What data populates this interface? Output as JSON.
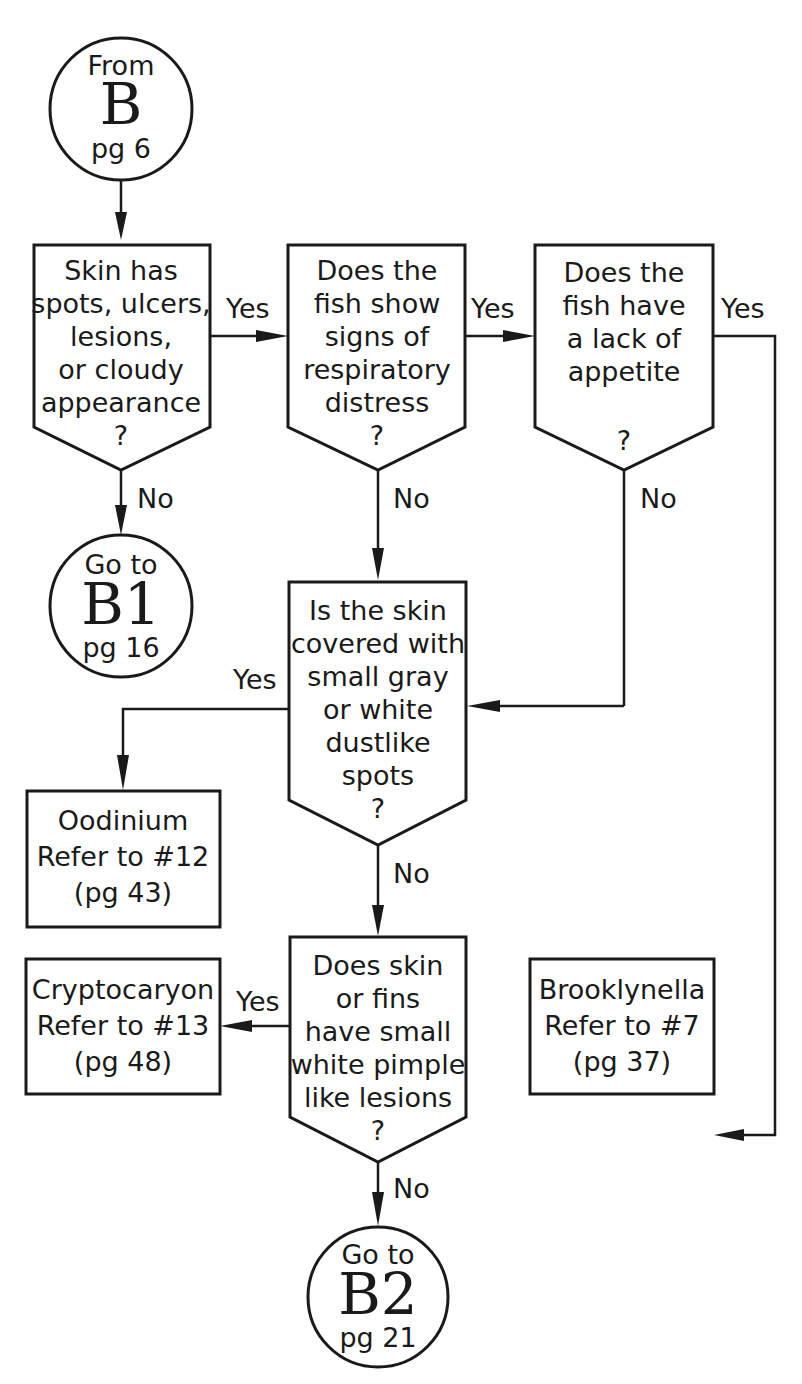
{
  "flowchart": {
    "start": {
      "line1": "From",
      "code": "B",
      "page": "pg 6"
    },
    "q1": {
      "lines": [
        "Skin has",
        "spots, ulcers,",
        "lesions,",
        "or cloudy",
        "appearance",
        "?"
      ]
    },
    "q2": {
      "lines": [
        "Does the",
        "fish show",
        "signs of",
        "respiratory",
        "distress",
        "?"
      ]
    },
    "q3": {
      "lines": [
        "Does the",
        "fish have",
        "a lack of",
        "appetite",
        "",
        "?"
      ]
    },
    "q4": {
      "lines": [
        "Is the skin",
        "covered with",
        "small gray",
        "or white",
        "dustlike",
        "spots",
        "?"
      ]
    },
    "q5": {
      "lines": [
        "Does skin",
        "or fins",
        "have small",
        "white pimple",
        "like lesions",
        "?"
      ]
    },
    "goto_b1": {
      "line1": "Go to",
      "code": "B1",
      "page": "pg 16"
    },
    "goto_b2": {
      "line1": "Go to",
      "code": "B2",
      "page": "pg 21"
    },
    "result_oodinium": {
      "lines": [
        "Oodinium",
        "Refer to #12",
        "(pg 43)"
      ]
    },
    "result_cryptocaryon": {
      "lines": [
        "Cryptocaryon",
        "Refer to #13",
        "(pg 48)"
      ]
    },
    "result_brooklynella": {
      "lines": [
        "Brooklynella",
        "Refer to #7",
        "(pg 37)"
      ]
    },
    "labels": {
      "q1_yes": "Yes",
      "q1_no": "No",
      "q2_yes": "Yes",
      "q2_no": "No",
      "q3_yes": "Yes",
      "q3_no": "No",
      "q4_yes": "Yes",
      "q4_no": "No",
      "q5_yes": "Yes",
      "q5_no": "No"
    }
  }
}
